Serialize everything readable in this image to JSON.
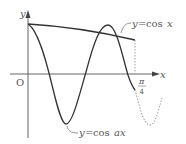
{
  "diagram": {
    "type": "function-graph",
    "axes": {
      "x_label": "x",
      "y_label": "y",
      "origin_label": "O",
      "x_tick_label_num": "π",
      "x_tick_label_den": "4"
    },
    "curves": [
      {
        "name": "cos x",
        "label_y": "y",
        "label_eq": "=",
        "label_fn": "cos",
        "label_arg": "x",
        "style": "solid"
      },
      {
        "name": "cos ax",
        "label_y": "y",
        "label_eq": "=",
        "label_fn": "cos",
        "label_arg": "ax",
        "style": "solid, continues dotted beyond π/4"
      }
    ],
    "colors": {
      "line": "#333333",
      "dotted": "#777777",
      "text": "#555555"
    }
  }
}
